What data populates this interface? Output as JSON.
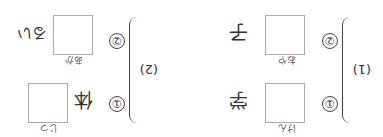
{
  "sections": [
    {
      "label": "(1)",
      "items": [
        {
          "num": "①",
          "reading": "けん",
          "kanji": "学"
        },
        {
          "num": "②",
          "reading": "おや",
          "kanji": "子"
        }
      ]
    },
    {
      "label": "(2)",
      "items": [
        {
          "num": "①",
          "kanji": "体",
          "reading": "じつ"
        },
        {
          "num": "②",
          "reading": "あか",
          "kanji": "るい"
        }
      ]
    }
  ]
}
